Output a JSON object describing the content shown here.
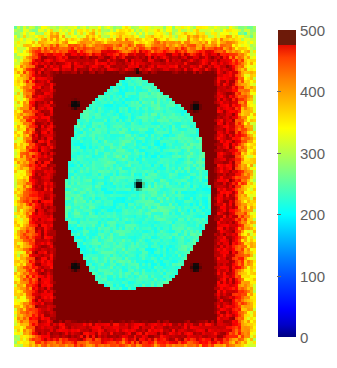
{
  "figure": {
    "kind": "pseudocolor-image-with-colorbar",
    "background_color": "#ffffff"
  },
  "colorbar": {
    "colormap": "jet",
    "orientation": "vertical",
    "min": 0,
    "max": 500,
    "tick_labels": [
      "500",
      "400",
      "300",
      "200",
      "100",
      "0"
    ],
    "tick_values": [
      500,
      400,
      300,
      200,
      100,
      0
    ],
    "label_color": "#5e5e5e",
    "top_color": "#6d1a09",
    "bottom_color": "#00007f"
  },
  "chart_data": {
    "type": "heatmap",
    "title": "",
    "xlabel": "",
    "ylabel": "",
    "colormap": "jet",
    "clim": [
      0,
      500
    ],
    "grid": false,
    "legend_position": "right",
    "colorbar_ticks": [
      0,
      100,
      200,
      300,
      400,
      500
    ],
    "regions": [
      {
        "name": "outer-background",
        "approx_value": 250,
        "color": "#5fc1a8"
      },
      {
        "name": "mid-halo",
        "approx_value": 330,
        "color": "#f2e24a"
      },
      {
        "name": "inner-halo",
        "approx_value": 430,
        "color": "#f2622a"
      },
      {
        "name": "saturated-plateau",
        "approx_value": 500,
        "color": "#7e1508"
      },
      {
        "name": "central-disc",
        "approx_value": 215,
        "color": "#86cfd4"
      }
    ],
    "markers": [
      {
        "name": "marker-top-edge",
        "x_frac": 0.513,
        "y_frac": 0.14,
        "value": 0
      },
      {
        "name": "marker-upper-left",
        "x_frac": 0.252,
        "y_frac": 0.246,
        "value": 0
      },
      {
        "name": "marker-upper-right",
        "x_frac": 0.752,
        "y_frac": 0.252,
        "value": 0
      },
      {
        "name": "marker-center",
        "x_frac": 0.517,
        "y_frac": 0.495,
        "value": 0
      },
      {
        "name": "marker-lower-left",
        "x_frac": 0.252,
        "y_frac": 0.75,
        "value": 0
      },
      {
        "name": "marker-lower-right",
        "x_frac": 0.752,
        "y_frac": 0.752,
        "value": 0
      }
    ]
  }
}
